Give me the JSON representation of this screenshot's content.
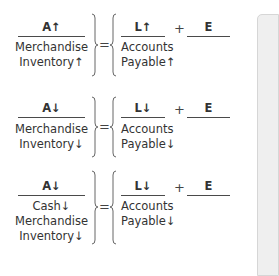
{
  "equations": [
    {
      "assets": {
        "header": "A↑",
        "items": [
          "Merchandise",
          "Inventory↑"
        ]
      },
      "equals": "=",
      "liabilities": {
        "header": "L↑",
        "items": [
          "Accounts",
          "Payable↑"
        ]
      },
      "plus": "+",
      "equity": {
        "header": "E",
        "items": []
      }
    },
    {
      "assets": {
        "header": "A↓",
        "items": [
          "Merchandise",
          "Inventory↓"
        ]
      },
      "equals": "=",
      "liabilities": {
        "header": "L↓",
        "items": [
          "Accounts",
          "Payable↓"
        ]
      },
      "plus": "+",
      "equity": {
        "header": "E",
        "items": []
      }
    },
    {
      "assets": {
        "header": "A↓",
        "items": [
          "Cash↓",
          "Merchandise",
          "Inventory↓"
        ]
      },
      "equals": "=",
      "liabilities": {
        "header": "L↓",
        "items": [
          "Accounts",
          "Payable↓"
        ]
      },
      "plus": "+",
      "equity": {
        "header": "E",
        "items": []
      }
    }
  ],
  "colors": {
    "text": "#333333",
    "rule": "#4a4a4a",
    "panel": "#efefef"
  }
}
